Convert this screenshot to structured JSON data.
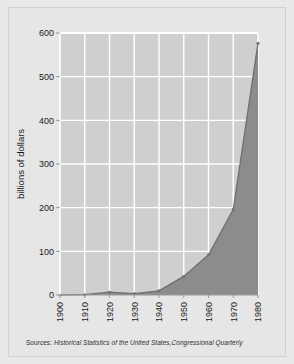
{
  "figure": {
    "background_color": "#e9e9e9",
    "frame_color": "#e6e6e6",
    "border_color": "#d2d2d2"
  },
  "source_note": {
    "prefix": "Sources:",
    "text": " Historical Statistics of the United States,Congressional Quarterly"
  },
  "chart_data": {
    "type": "area",
    "title": "",
    "subtitle": "",
    "xlabel": "",
    "ylabel": "billions of dollars",
    "x": [
      1900,
      1910,
      1920,
      1930,
      1940,
      1950,
      1960,
      1970,
      1980
    ],
    "categories": [
      "1900",
      "1910",
      "1920",
      "1930",
      "1940",
      "1950",
      "1960",
      "1970",
      "1980"
    ],
    "values": [
      0.5,
      0.7,
      6.4,
      3.3,
      9.5,
      42.6,
      92.2,
      195.6,
      576.7
    ],
    "series": [
      {
        "name": "federal spending",
        "values": [
          0.5,
          0.7,
          6.4,
          3.3,
          9.5,
          42.6,
          92.2,
          195.6,
          576.7
        ]
      }
    ],
    "xlim": [
      1900,
      1980
    ],
    "ylim": [
      0,
      600
    ],
    "yticks": [
      0,
      100,
      200,
      300,
      400,
      500,
      600
    ],
    "ytick_labels": [
      "0",
      "100",
      "200",
      "300",
      "400",
      "500",
      "600"
    ],
    "xticks": [
      1900,
      1910,
      1920,
      1930,
      1940,
      1950,
      1960,
      1970,
      1980
    ],
    "xtick_labels": [
      "1900",
      "1910",
      "1920",
      "1930",
      "1940",
      "1950",
      "1960",
      "1970",
      "1980"
    ],
    "xtick_rotation": 90,
    "grid": true,
    "grid_color": "#ffffff",
    "plot_bg_color": "#cfcfcf",
    "area_fill_color": "#8c8c8c",
    "line_color": "#6f6f6f",
    "marker_color": "#707070",
    "legend": false,
    "legend_position": "none"
  }
}
